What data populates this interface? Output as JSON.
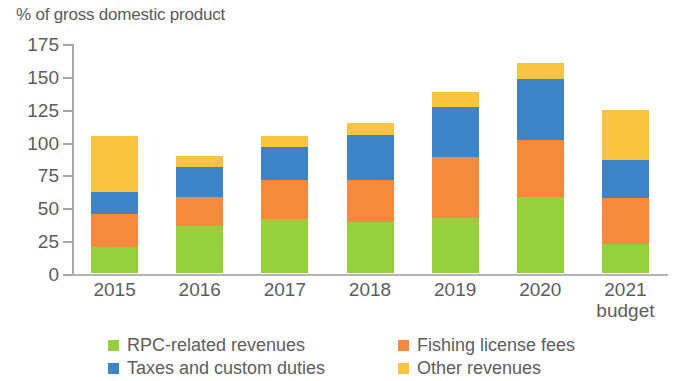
{
  "chart_data": {
    "type": "bar",
    "subtype": "stacked-bar",
    "title": "",
    "ylabel": "% of gross domestic product",
    "xlabel": "",
    "ylim": [
      0,
      175
    ],
    "yticks": [
      0,
      25,
      50,
      75,
      100,
      125,
      150,
      175
    ],
    "ytick_labels": [
      "0",
      "25",
      "50",
      "75",
      "100",
      "125",
      "150",
      "175"
    ],
    "grid": false,
    "legend_position": "bottom",
    "categories": [
      "2015",
      "2016",
      "2017",
      "2018",
      "2019",
      "2020",
      "2021"
    ],
    "category_sublabels": [
      "",
      "",
      "",
      "",
      "",
      "",
      "budget"
    ],
    "series": [
      {
        "name": "RPC-related revenues",
        "color": "#94d13d",
        "values": [
          20,
          36,
          41,
          39,
          42,
          58,
          22
        ]
      },
      {
        "name": "Fishing license fees",
        "color": "#f58a3c",
        "values": [
          25,
          22,
          30,
          32,
          46,
          43,
          35
        ]
      },
      {
        "name": "Taxes and custom duties",
        "color": "#3d85c6",
        "values": [
          17,
          23,
          25,
          34,
          38,
          47,
          29
        ]
      },
      {
        "name": "Other revenues",
        "color": "#f9c440",
        "values": [
          42,
          8,
          8,
          9,
          12,
          12,
          38
        ]
      }
    ],
    "totals": [
      104,
      89,
      104,
      114,
      138,
      160,
      124
    ]
  }
}
